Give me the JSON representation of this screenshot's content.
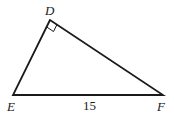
{
  "diagram": {
    "type": "right-triangle",
    "vertices": {
      "D": {
        "label": "D",
        "x": 50,
        "y": 20
      },
      "E": {
        "label": "E",
        "x": 13,
        "y": 95
      },
      "F": {
        "label": "F",
        "x": 163,
        "y": 95
      }
    },
    "right_angle_at": "D",
    "sides": [
      {
        "from": "E",
        "to": "F",
        "length_label": "15"
      }
    ],
    "stroke_color": "#1a1a1a"
  }
}
